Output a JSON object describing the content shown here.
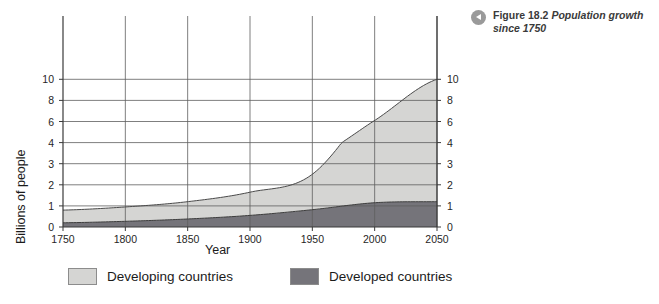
{
  "figure": {
    "icon": "triangle-left-circle-icon",
    "label": "Figure 18.2",
    "title": "Population growth since 1750"
  },
  "legend": {
    "items": [
      {
        "label": "Developing countries",
        "color": "#d5d5d3",
        "key": "developing"
      },
      {
        "label": "Developed countries",
        "color": "#75747a",
        "key": "developed"
      }
    ]
  },
  "chart_data": {
    "type": "area",
    "title": "Population growth since 1750",
    "xlabel": "Year",
    "ylabel": "Billions of people",
    "xlim": [
      1750,
      2050
    ],
    "ylim": [
      0,
      10
    ],
    "grid": true,
    "stacked": true,
    "legend_position": "bottom",
    "y_axis_note": "Non-linear axis: equal spacing for 0,1,2,3,4 then half-rate spacing for 4,6,8,10",
    "xticks": [
      1750,
      1800,
      1850,
      1900,
      1950,
      2000,
      2050
    ],
    "xticklabels": [
      "1750",
      "1800",
      "1850",
      "1900",
      "1950",
      "2000",
      "2050"
    ],
    "yticks": [
      0,
      1,
      2,
      3,
      4,
      6,
      8,
      10
    ],
    "yticklabels": [
      "0",
      "1",
      "2",
      "3",
      "4",
      "6",
      "8",
      "10"
    ],
    "yticks_right": [
      0,
      1,
      2,
      3,
      4,
      6,
      8,
      10
    ],
    "yticklabels_right": [
      "0",
      "1",
      "2",
      "3",
      "4",
      "6",
      "8",
      "10"
    ],
    "x": [
      1750,
      1800,
      1850,
      1900,
      1950,
      2000,
      2050
    ],
    "series": [
      {
        "name": "Developed countries",
        "color": "#75747a",
        "values": [
          0.2,
          0.27,
          0.38,
          0.55,
          0.82,
          1.15,
          1.2
        ]
      },
      {
        "name": "Developing countries",
        "color": "#d5d5d3",
        "values": [
          0.6,
          0.68,
          0.82,
          1.1,
          1.68,
          4.95,
          8.8
        ]
      }
    ],
    "totals": [
      0.8,
      0.95,
      1.2,
      1.65,
      2.5,
      6.1,
      10.0
    ]
  }
}
